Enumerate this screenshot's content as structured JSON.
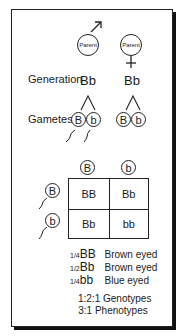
{
  "male_parent": {
    "label": "Parent",
    "symbol": "male"
  },
  "female_parent": {
    "label": "Parent",
    "symbol": "female"
  },
  "generation": {
    "label": "Generation",
    "male_genotype": "Bb",
    "female_genotype": "Bb"
  },
  "gametes": {
    "label": "Gametes",
    "male": [
      "B",
      "b"
    ],
    "female": [
      "B",
      "b"
    ]
  },
  "punnett": {
    "top_alleles": [
      "B",
      "b"
    ],
    "side_alleles": [
      "B",
      "b"
    ],
    "cells": [
      [
        "BB",
        "Bb"
      ],
      [
        "Bb",
        "bb"
      ]
    ]
  },
  "results": [
    {
      "fraction": "1/4",
      "genotype": "BB",
      "phenotype": "Brown eyed"
    },
    {
      "fraction": "1/2",
      "genotype": "Bb",
      "phenotype": "Brown eyed"
    },
    {
      "fraction": "1/4",
      "genotype": "bb",
      "phenotype": "Blue eyed"
    }
  ],
  "ratios": {
    "genotype": "1:2:1 Genotypes",
    "phenotype": "3:1 Phenotypes"
  }
}
